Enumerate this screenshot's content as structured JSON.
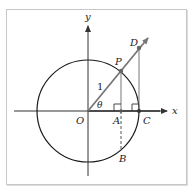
{
  "diagram": {
    "colors": {
      "axis": "#333333",
      "circle": "#1a1a1a",
      "ray": "#777777",
      "tangent": "#777777",
      "frame": "#c8c8c8"
    },
    "labels": {
      "x_axis": "x",
      "y_axis": "y",
      "origin": "O",
      "point_P": "P",
      "point_D": "D",
      "point_A": "A",
      "point_B": "B",
      "point_C": "C",
      "radius": "1",
      "angle": "θ"
    },
    "elements": [
      {
        "id": "circle",
        "type": "circle",
        "center": "O",
        "radius_label": "1"
      },
      {
        "id": "ray-OD",
        "type": "ray",
        "from": "O",
        "through": [
          "P",
          "D"
        ]
      },
      {
        "id": "segment-PA",
        "type": "segment",
        "from": "P",
        "to": "A",
        "style": "solid"
      },
      {
        "id": "segment-AB",
        "type": "segment",
        "from": "A",
        "to": "B",
        "style": "dashed"
      },
      {
        "id": "segment-DC",
        "type": "segment",
        "from": "D",
        "to": "C",
        "style": "solid"
      },
      {
        "id": "right-angle-A",
        "type": "right-angle-marker",
        "at": "A"
      },
      {
        "id": "right-angle-C",
        "type": "right-angle-marker",
        "at": "C"
      }
    ]
  }
}
